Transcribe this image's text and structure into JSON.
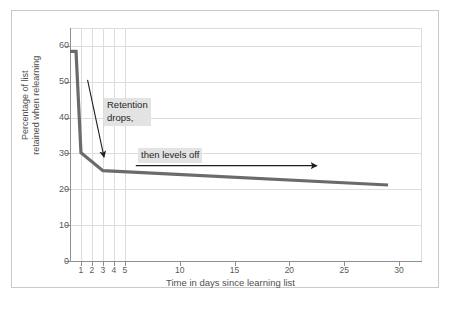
{
  "chart_data": {
    "type": "line",
    "title": "",
    "xlabel": "Time in days since learning list",
    "ylabel_line1": "Percentage of list",
    "ylabel_line2": "retained when relearning",
    "xlim": [
      0,
      32
    ],
    "ylim": [
      0,
      65
    ],
    "grid": true,
    "legend": "none",
    "x_ticks": [
      1,
      2,
      3,
      4,
      5,
      10,
      15,
      20,
      25,
      30
    ],
    "x_tick_labels": [
      "1",
      "2",
      "3",
      "4",
      "5",
      "10",
      "15",
      "20",
      "25",
      "30"
    ],
    "y_ticks": [
      0,
      10,
      20,
      30,
      40,
      50,
      60
    ],
    "y_tick_labels": [
      "0",
      "10",
      "20",
      "30",
      "40",
      "50",
      "60"
    ],
    "series": [
      {
        "name": "Percentage retained",
        "color": "#6b6b6b",
        "x": [
          0.0,
          0.55,
          1.0,
          3.0,
          29.0
        ],
        "values": [
          58.5,
          58.5,
          30.2,
          25.2,
          21.2
        ]
      }
    ],
    "annotations": [
      {
        "name": "retention-drops",
        "text": "Retention\ndrops,",
        "highlight_color": "#e3e3e3",
        "arrow": "diagonal-down-right",
        "arrow_from": {
          "x": 1.6,
          "y": 50.5
        },
        "arrow_to": {
          "x": 3.1,
          "y": 29.0
        }
      },
      {
        "name": "then-levels-off",
        "text": "then levels off",
        "highlight_color": "#e3e3e3",
        "arrow": "horizontal-right",
        "arrow_from": {
          "x": 6.0,
          "y": 26.6
        },
        "arrow_to": {
          "x": 22.5,
          "y": 26.6
        }
      }
    ]
  },
  "figure": {
    "frame_color": "#c9c9c9",
    "background": "#ffffff",
    "grid_color": "#dcdcdc",
    "axis_color": "#8f8f8f",
    "tick_text_color": "#5a5a5a",
    "axis_title_color": "#4f4f4f"
  }
}
